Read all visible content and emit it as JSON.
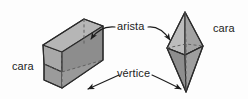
{
  "figure": {
    "background_color": "#fdfdfd",
    "width": 248,
    "height": 99,
    "language": "es"
  },
  "labels": {
    "face_left": "cara",
    "edge": "arista",
    "vertex": "vértice",
    "face_right": "cara"
  },
  "solids": [
    {
      "name": "triangular-prism",
      "position": "left",
      "colors": {
        "top": "#b4b4b4",
        "front": "#8e8e8e",
        "left": "#a6a6a6",
        "bottom": "#9a9a9a",
        "outline": "#2b2b2b",
        "hidden_edge": "#5a5a5a"
      }
    },
    {
      "name": "square-bipyramid",
      "position": "right",
      "colors": {
        "upper_left": "#b9b9b9",
        "upper_right": "#a0a0a0",
        "lower_left": "#8d8d8d",
        "lower_right": "#9c9c9c",
        "outline": "#2b2b2b",
        "hidden_edge": "#5a5a5a"
      }
    }
  ],
  "arrows": [
    {
      "name": "arrow-edge-to-prism",
      "from": "arista",
      "to": "triangular-prism-edge"
    },
    {
      "name": "arrow-edge-to-bipyramid",
      "from": "arista",
      "to": "square-bipyramid-edge"
    },
    {
      "name": "arrow-vertex-to-prism",
      "from": "vértice",
      "to": "triangular-prism-vertex"
    },
    {
      "name": "arrow-vertex-to-bipyramid",
      "from": "vértice",
      "to": "square-bipyramid-vertex"
    }
  ],
  "colors": {
    "text": "#1c1c1c",
    "stroke": "#2b2b2b"
  }
}
